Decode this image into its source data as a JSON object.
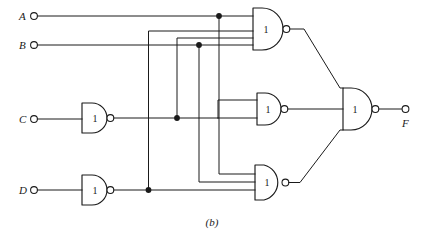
{
  "figure": {
    "caption": "(b)",
    "kind": "logic-circuit-diagram",
    "notation": "NAND gate network, distinctive-shape symbols with internal '1' label",
    "ink_color": "#1a1a1a",
    "background_color": "#ffffff"
  },
  "inputs": [
    {
      "id": "A",
      "label": "A",
      "terminal": "open-circle"
    },
    {
      "id": "B",
      "label": "B",
      "terminal": "open-circle"
    },
    {
      "id": "C",
      "label": "C",
      "terminal": "open-circle"
    },
    {
      "id": "D",
      "label": "D",
      "terminal": "open-circle"
    }
  ],
  "outputs": [
    {
      "id": "F",
      "label": "F",
      "terminal": "open-circle"
    }
  ],
  "gates": [
    {
      "id": "g-inv-c",
      "label": "1",
      "type": "nand",
      "inputs_count": 1,
      "role": "inverter-c",
      "inverting_bubble": true
    },
    {
      "id": "g-inv-d",
      "label": "1",
      "type": "nand",
      "inputs_count": 1,
      "role": "inverter-d",
      "inverting_bubble": true
    },
    {
      "id": "g-top",
      "label": "1",
      "type": "nand",
      "inputs_count": 3,
      "role": "term-1",
      "inverting_bubble": true
    },
    {
      "id": "g-middle",
      "label": "1",
      "type": "nand",
      "inputs_count": 2,
      "role": "term-2",
      "inverting_bubble": true
    },
    {
      "id": "g-bottom",
      "label": "1",
      "type": "nand",
      "inputs_count": 3,
      "role": "term-3",
      "inverting_bubble": true
    },
    {
      "id": "g-output",
      "label": "1",
      "type": "nand",
      "inputs_count": 3,
      "role": "output-combiner",
      "inverting_bubble": true
    }
  ],
  "junction_dots": [
    {
      "id": "dot-a",
      "on_net": "A"
    },
    {
      "id": "dot-b",
      "on_net": "B"
    },
    {
      "id": "dot-c-bar",
      "on_net": "C-bar"
    },
    {
      "id": "dot-d-bar",
      "on_net": "D-bar"
    }
  ]
}
